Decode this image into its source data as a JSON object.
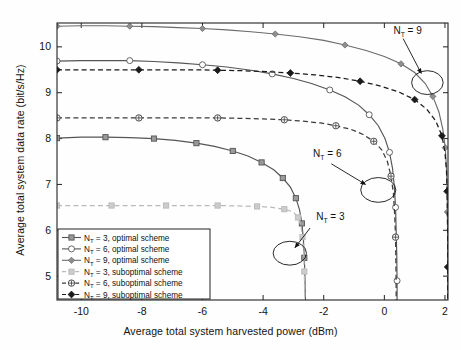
{
  "chart_data": {
    "type": "line",
    "title": "",
    "xlabel": "Average total system harvested power (dBm)",
    "ylabel": "Average total system data rate (bit/s/Hz)",
    "xlim": [
      -10.8,
      2.1
    ],
    "ylim": [
      4.48,
      10.52
    ],
    "xticks": [
      -10,
      -8,
      -6,
      -4,
      -2,
      0,
      2
    ],
    "xticklabels": [
      "-10",
      "-8",
      "-6",
      "-4",
      "-2",
      "0",
      "2"
    ],
    "yticks": [
      5,
      6,
      7,
      8,
      9,
      10
    ],
    "yticklabels": [
      "5",
      "6",
      "7",
      "8",
      "9",
      "10"
    ],
    "grid": false,
    "legend_position": "lower left",
    "series": [
      {
        "name": "N_T = 3, optimal scheme",
        "label_prefix": "N",
        "label_sub": "T",
        "label_rest": " = 3, optimal scheme",
        "nt": 3,
        "scheme": "optimal",
        "color": "#555555",
        "dash": "solid",
        "marker": "square",
        "marker_fill": "#9a9a9a",
        "points": [
          [
            -10.8,
            8.01
          ],
          [
            -10.0,
            8.03
          ],
          [
            -9.2,
            8.03
          ],
          [
            -8.4,
            8.02
          ],
          [
            -7.6,
            8.0
          ],
          [
            -6.9,
            7.96
          ],
          [
            -6.2,
            7.9
          ],
          [
            -5.6,
            7.83
          ],
          [
            -5.0,
            7.73
          ],
          [
            -4.5,
            7.62
          ],
          [
            -4.05,
            7.48
          ],
          [
            -3.65,
            7.32
          ],
          [
            -3.35,
            7.14
          ],
          [
            -3.1,
            6.94
          ],
          [
            -2.92,
            6.7
          ],
          [
            -2.8,
            6.45
          ],
          [
            -2.72,
            6.15
          ],
          [
            -2.67,
            5.8
          ],
          [
            -2.64,
            5.4
          ],
          [
            -2.62,
            5.0
          ],
          [
            -2.61,
            4.6
          ],
          [
            -2.6,
            4.48
          ]
        ]
      },
      {
        "name": "N_T = 6, optimal scheme",
        "label_prefix": "N",
        "label_sub": "T",
        "label_rest": " = 6, optimal scheme",
        "nt": 6,
        "scheme": "optimal",
        "color": "#555555",
        "dash": "solid",
        "marker": "circle-open",
        "marker_fill": "#ffffff",
        "points": [
          [
            -10.8,
            9.69
          ],
          [
            -10.0,
            9.7
          ],
          [
            -9.2,
            9.7
          ],
          [
            -8.4,
            9.7
          ],
          [
            -7.6,
            9.68
          ],
          [
            -6.8,
            9.65
          ],
          [
            -6.0,
            9.61
          ],
          [
            -5.2,
            9.56
          ],
          [
            -4.4,
            9.49
          ],
          [
            -3.7,
            9.41
          ],
          [
            -3.0,
            9.31
          ],
          [
            -2.4,
            9.2
          ],
          [
            -1.8,
            9.06
          ],
          [
            -1.3,
            8.91
          ],
          [
            -0.85,
            8.73
          ],
          [
            -0.5,
            8.52
          ],
          [
            -0.2,
            8.28
          ],
          [
            0.02,
            8.0
          ],
          [
            0.17,
            7.7
          ],
          [
            0.27,
            7.35
          ],
          [
            0.33,
            6.95
          ],
          [
            0.37,
            6.5
          ],
          [
            0.39,
            6.0
          ],
          [
            0.41,
            5.45
          ],
          [
            0.42,
            4.9
          ],
          [
            0.42,
            4.48
          ]
        ]
      },
      {
        "name": "N_T = 9, optimal scheme",
        "label_prefix": "N",
        "label_sub": "T",
        "label_rest": " = 9, optimal scheme",
        "nt": 9,
        "scheme": "optimal",
        "color": "#6b6b6b",
        "dash": "solid",
        "marker": "diamond",
        "marker_fill": "#8f8f8f",
        "points": [
          [
            -10.8,
            10.45
          ],
          [
            -10.0,
            10.46
          ],
          [
            -9.2,
            10.46
          ],
          [
            -8.4,
            10.45
          ],
          [
            -7.6,
            10.44
          ],
          [
            -6.8,
            10.42
          ],
          [
            -6.0,
            10.4
          ],
          [
            -5.2,
            10.37
          ],
          [
            -4.4,
            10.33
          ],
          [
            -3.6,
            10.28
          ],
          [
            -2.8,
            10.22
          ],
          [
            -2.0,
            10.14
          ],
          [
            -1.3,
            10.04
          ],
          [
            -0.6,
            9.92
          ],
          [
            0.0,
            9.79
          ],
          [
            0.55,
            9.63
          ],
          [
            1.0,
            9.44
          ],
          [
            1.35,
            9.2
          ],
          [
            1.6,
            8.92
          ],
          [
            1.8,
            8.58
          ],
          [
            1.93,
            8.2
          ],
          [
            2.01,
            7.8
          ],
          [
            2.05,
            7.35
          ],
          [
            2.07,
            6.9
          ],
          [
            2.08,
            6.4
          ],
          [
            2.09,
            5.8
          ],
          [
            2.09,
            5.2
          ],
          [
            2.1,
            4.48
          ]
        ]
      },
      {
        "name": "N_T = 3, suboptimal scheme",
        "label_prefix": "N",
        "label_sub": "T",
        "label_rest": " = 3, suboptimal scheme",
        "nt": 3,
        "scheme": "suboptimal",
        "color": "#b9b9b9",
        "dash": "dashed",
        "marker": "square",
        "marker_fill": "#cccccc",
        "points": [
          [
            -10.8,
            6.54
          ],
          [
            -9.9,
            6.54
          ],
          [
            -9.0,
            6.54
          ],
          [
            -8.1,
            6.54
          ],
          [
            -7.2,
            6.54
          ],
          [
            -6.3,
            6.54
          ],
          [
            -5.5,
            6.54
          ],
          [
            -4.8,
            6.53
          ],
          [
            -4.2,
            6.52
          ],
          [
            -3.7,
            6.5
          ],
          [
            -3.3,
            6.46
          ],
          [
            -3.0,
            6.4
          ],
          [
            -2.85,
            6.28
          ],
          [
            -2.75,
            6.1
          ],
          [
            -2.7,
            5.85
          ],
          [
            -2.66,
            5.5
          ],
          [
            -2.64,
            5.1
          ],
          [
            -2.63,
            4.7
          ],
          [
            -2.62,
            4.48
          ]
        ]
      },
      {
        "name": "N_T = 6, suboptimal scheme",
        "label_prefix": "N",
        "label_sub": "T",
        "label_rest": " = 6, suboptimal scheme",
        "nt": 6,
        "scheme": "suboptimal",
        "color": "#3c3c3c",
        "dash": "dashed",
        "marker": "circle-cross",
        "marker_fill": "#ffffff",
        "points": [
          [
            -10.8,
            8.45
          ],
          [
            -9.9,
            8.45
          ],
          [
            -9.0,
            8.45
          ],
          [
            -8.1,
            8.45
          ],
          [
            -7.2,
            8.45
          ],
          [
            -6.3,
            8.45
          ],
          [
            -5.5,
            8.45
          ],
          [
            -4.7,
            8.44
          ],
          [
            -4.0,
            8.43
          ],
          [
            -3.3,
            8.41
          ],
          [
            -2.7,
            8.38
          ],
          [
            -2.1,
            8.34
          ],
          [
            -1.6,
            8.28
          ],
          [
            -1.1,
            8.2
          ],
          [
            -0.7,
            8.09
          ],
          [
            -0.35,
            7.94
          ],
          [
            -0.08,
            7.75
          ],
          [
            0.1,
            7.5
          ],
          [
            0.22,
            7.18
          ],
          [
            0.3,
            6.8
          ],
          [
            0.34,
            6.35
          ],
          [
            0.37,
            5.85
          ],
          [
            0.38,
            5.3
          ],
          [
            0.39,
            4.75
          ],
          [
            0.39,
            4.48
          ]
        ]
      },
      {
        "name": "N_T = 9, suboptimal scheme",
        "label_prefix": "N",
        "label_sub": "T",
        "label_rest": " = 9, suboptimal scheme",
        "nt": 9,
        "scheme": "suboptimal",
        "color": "#1a1a1a",
        "dash": "dashed",
        "marker": "diamond-filled",
        "marker_fill": "#1a1a1a",
        "points": [
          [
            -10.8,
            9.5
          ],
          [
            -9.9,
            9.5
          ],
          [
            -9.0,
            9.5
          ],
          [
            -8.1,
            9.5
          ],
          [
            -7.2,
            9.5
          ],
          [
            -6.3,
            9.5
          ],
          [
            -5.5,
            9.49
          ],
          [
            -4.7,
            9.48
          ],
          [
            -3.9,
            9.46
          ],
          [
            -3.1,
            9.43
          ],
          [
            -2.3,
            9.39
          ],
          [
            -1.5,
            9.33
          ],
          [
            -0.8,
            9.25
          ],
          [
            -0.1,
            9.14
          ],
          [
            0.5,
            9.01
          ],
          [
            1.0,
            8.85
          ],
          [
            1.4,
            8.64
          ],
          [
            1.7,
            8.38
          ],
          [
            1.9,
            8.06
          ],
          [
            2.0,
            7.7
          ],
          [
            2.05,
            7.3
          ],
          [
            2.07,
            6.85
          ],
          [
            2.08,
            6.35
          ],
          [
            2.09,
            5.8
          ],
          [
            2.09,
            5.2
          ],
          [
            2.09,
            4.48
          ]
        ]
      }
    ],
    "annotations": [
      {
        "id": "nt9",
        "text_prefix": "N",
        "text_sub": "T",
        "text_rest": " = 9",
        "text": "N_T = 9",
        "text_x": 0.3,
        "text_y": 10.28,
        "arrow_from_x": 0.62,
        "arrow_from_y": 10.18,
        "arrow_to_x": 1.22,
        "arrow_to_y": 9.42,
        "ellipse_cx": 1.42,
        "ellipse_cy": 9.22,
        "ellipse_rx": 0.52,
        "ellipse_ry": 0.26
      },
      {
        "id": "nt6",
        "text_prefix": "N",
        "text_sub": "T",
        "text_rest": " = 6",
        "text": "N_T = 6",
        "text_x": -2.35,
        "text_y": 7.6,
        "arrow_from_x": -1.75,
        "arrow_from_y": 7.45,
        "arrow_to_x": -0.62,
        "arrow_to_y": 7.0,
        "ellipse_cx": -0.2,
        "ellipse_cy": 6.88,
        "ellipse_rx": 0.58,
        "ellipse_ry": 0.27
      },
      {
        "id": "nt3",
        "text_prefix": "N",
        "text_sub": "T",
        "text_rest": " = 3",
        "text": "N_T = 3",
        "text_x": -2.25,
        "text_y": 6.22,
        "arrow_from_x": -2.45,
        "arrow_from_y": 6.05,
        "arrow_to_x": -2.95,
        "arrow_to_y": 5.62,
        "ellipse_cx": -3.12,
        "ellipse_cy": 5.5,
        "ellipse_rx": 0.55,
        "ellipse_ry": 0.26
      }
    ]
  }
}
